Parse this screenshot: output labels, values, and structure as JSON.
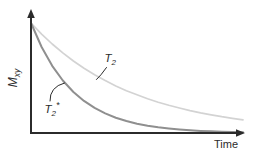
{
  "figure": {
    "background": "#ffffff",
    "axis_color": "#2b2b2b",
    "text_color": "#2b2b2b",
    "x_axis_label": "Time",
    "y_axis_label": {
      "main": "M",
      "sub": "xy"
    }
  },
  "chart_data": {
    "type": "line",
    "xlabel": "Time",
    "ylabel": "Mxy",
    "axes": {
      "ticks": false,
      "grid": false,
      "arrows": true,
      "numeric_labels": false
    },
    "x": [
      0,
      0.05,
      0.1,
      0.15,
      0.2,
      0.25,
      0.3,
      0.35,
      0.4,
      0.45,
      0.5,
      0.55,
      0.6,
      0.65,
      0.7,
      0.75,
      0.8,
      0.85,
      0.9,
      0.95,
      1
    ],
    "series": [
      {
        "name": "T2",
        "label": {
          "main": "T",
          "sub": "2",
          "sup": ""
        },
        "color": "#d3d3d3",
        "stroke_width": 1.7,
        "y": [
          1,
          0.899,
          0.809,
          0.728,
          0.655,
          0.589,
          0.529,
          0.476,
          0.428,
          0.385,
          0.347,
          0.312,
          0.28,
          0.252,
          0.227,
          0.204,
          0.183,
          0.165,
          0.148,
          0.134,
          0.12
        ]
      },
      {
        "name": "T2*",
        "label": {
          "main": "T",
          "sub": "2",
          "sup": "*"
        },
        "color": "#8f8f8f",
        "stroke_width": 2,
        "y": [
          1,
          0.782,
          0.611,
          0.477,
          0.373,
          0.292,
          0.228,
          0.178,
          0.139,
          0.109,
          0.085,
          0.066,
          0.052,
          0.041,
          0.032,
          0.025,
          0.019,
          0.015,
          0.012,
          0.009,
          0.007
        ]
      }
    ],
    "annotations": [
      {
        "id": "T2",
        "x": 104.5,
        "y": 62,
        "leader": {
          "from": [
            106.5,
            67.5
          ],
          "ctrl": [
            100.5,
            76
          ],
          "to": [
            96.5,
            79.5
          ]
        }
      },
      {
        "id": "T2star",
        "x": 44.5,
        "y": 113,
        "leader": {
          "from": [
            50,
            101
          ],
          "ctrl": [
            49.5,
            87
          ],
          "to": [
            64.5,
            83
          ]
        }
      }
    ],
    "pixel_map": {
      "x0": 31,
      "x1": 243,
      "y_base": 133,
      "y_top": 23
    }
  }
}
